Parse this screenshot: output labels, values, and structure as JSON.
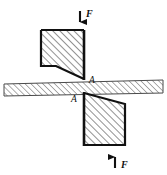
{
  "figure": {
    "kind": "engineering-mechanics-diagram",
    "background_color": "#ffffff",
    "outline_color": "#111111",
    "hatch_color": "#6e6e6e",
    "bar_hatch_color": "#8a8a8a"
  },
  "labels": {
    "force_top": "F",
    "force_bottom": "F",
    "section_top": "A",
    "section_bottom": "A"
  },
  "geometry": {
    "upper_block_points": "41,30 84,30 84,78 56,66 41,66",
    "lower_block_points": "84,94 125,104 125,145 84,145",
    "bar_points": "4,84 163,80 163,93 4,96",
    "upper_block_right_edge": "84,30 84,80",
    "lower_block_left_edge": "84,92 84,145",
    "arrow_top": {
      "x": 80,
      "y_start": 12,
      "y_end": 29,
      "direction": "down"
    },
    "arrow_bottom": {
      "x": 115,
      "y_start": 169,
      "y_end": 148,
      "direction": "up"
    }
  },
  "text_positions": {
    "force_top_label": {
      "x": 86,
      "y": 16
    },
    "force_bottom_label": {
      "x": 121,
      "y": 167
    },
    "section_top_label": {
      "x": 89,
      "y": 82
    },
    "section_bottom_label": {
      "x": 72,
      "y": 101
    }
  }
}
